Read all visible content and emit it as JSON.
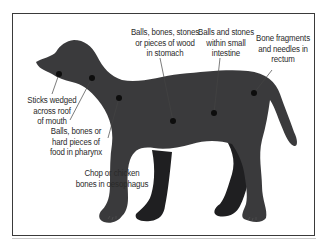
{
  "diagram": {
    "colors": {
      "body_near": "#3a3a3c",
      "body_far": "#1f1f21",
      "dot": "#0d0d0d",
      "leader": "#444444",
      "frame": "#3a3a3a",
      "text": "#2a2a2a"
    },
    "labels": [
      {
        "id": "mouth",
        "lines": [
          "Sticks wedged",
          "across roof",
          "of mouth"
        ],
        "dot": [
          59,
          74
        ]
      },
      {
        "id": "pharynx",
        "lines": [
          "Balls, bones or",
          "hard pieces of",
          "food in pharynx"
        ],
        "dot": [
          92,
          78
        ]
      },
      {
        "id": "oesophagus",
        "lines": [
          "Chop or chicken",
          "bones in oesophagus"
        ],
        "dot": [
          119,
          98
        ]
      },
      {
        "id": "stomach",
        "lines": [
          "Balls, bones, stones",
          "or pieces of wood",
          "in stomach"
        ],
        "dot": [
          173,
          121
        ]
      },
      {
        "id": "small-intestine",
        "lines": [
          "Balls and stones",
          "within small",
          "intestine"
        ],
        "dot": [
          214,
          113
        ]
      },
      {
        "id": "rectum",
        "lines": [
          "Bone fragments",
          "and needles in",
          "rectum"
        ],
        "dot": [
          254,
          93
        ]
      }
    ]
  }
}
